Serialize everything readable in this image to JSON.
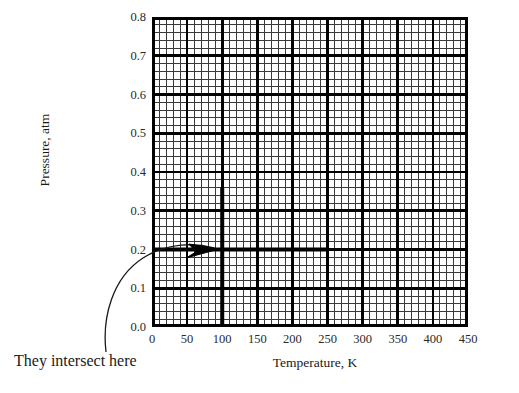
{
  "chart_data": {
    "type": "line",
    "title": "",
    "xlabel": "Temperature, K",
    "ylabel": "Pressure, atm",
    "xlim": [
      0,
      450
    ],
    "ylim": [
      0.0,
      0.8
    ],
    "xticks": [
      0,
      50,
      100,
      150,
      200,
      250,
      300,
      350,
      400,
      450
    ],
    "xtick_labels": [
      "0",
      "50",
      "100",
      "150",
      "200",
      "250",
      "300",
      "350",
      "400",
      "450"
    ],
    "yticks": [
      0.0,
      0.1,
      0.2,
      0.3,
      0.4,
      0.5,
      0.6,
      0.7,
      0.8
    ],
    "ytick_labels": [
      "0.0",
      "0.1",
      "0.2",
      "0.3",
      "0.4",
      "0.5",
      "0.6",
      "0.7",
      "0.8"
    ],
    "grid": true,
    "grid_major_x_step": 50,
    "grid_major_y_step": 0.1,
    "grid_minor_subdivisions": 5,
    "legend": null,
    "series": [
      {
        "name": "vertical-temperature-line",
        "orientation": "vertical",
        "x": 100,
        "y_from": 0.0,
        "y_to": 0.36,
        "color": "#000000",
        "linewidth": 4
      },
      {
        "name": "horizontal-pressure-line",
        "orientation": "horizontal",
        "y": 0.2,
        "x_from": 0,
        "x_to": 252,
        "color": "#000000",
        "linewidth": 4
      }
    ],
    "intersection_point": {
      "x": 100,
      "y": 0.2
    },
    "annotations": [
      {
        "text": "They intersect here",
        "points_to_x": 100,
        "points_to_y": 0.2,
        "arrow": "curved"
      }
    ]
  },
  "axes": {
    "y_title": "Pressure, atm",
    "x_title": "Temperature, K",
    "y_labels": [
      "0.8",
      "0.7",
      "0.6",
      "0.5",
      "0.4",
      "0.3",
      "0.2",
      "0.1",
      "0.0"
    ],
    "x_labels": [
      "0",
      "50",
      "100",
      "150",
      "200",
      "250",
      "300",
      "350",
      "400",
      "450"
    ]
  },
  "annotation": {
    "label": "They intersect here"
  },
  "colors": {
    "line": "#000000",
    "grid_major": "#111111",
    "grid_minor": "#333333",
    "background": "#ffffff",
    "text": "#1a1a1a"
  }
}
